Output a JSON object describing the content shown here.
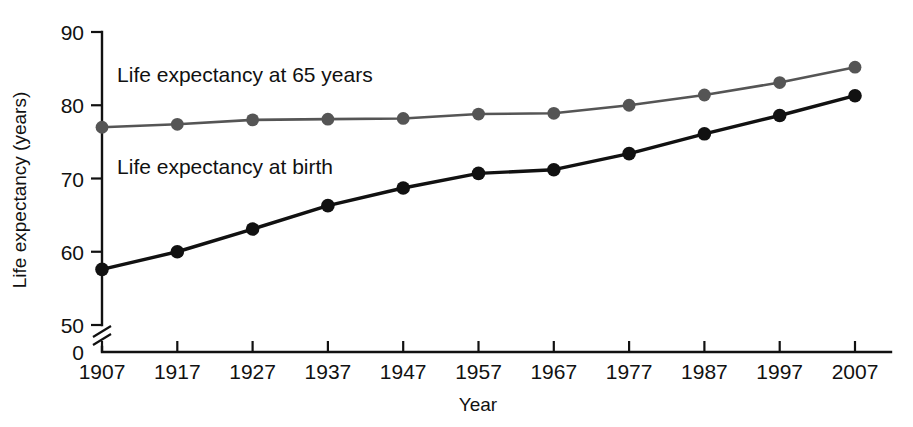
{
  "chart_data": {
    "type": "line",
    "title": "",
    "xlabel": "Year",
    "ylabel": "Life expectancy (years)",
    "categories": [
      "1907",
      "1917",
      "1927",
      "1937",
      "1947",
      "1957",
      "1967",
      "1977",
      "1987",
      "1997",
      "2007"
    ],
    "x": [
      1907,
      1917,
      1927,
      1937,
      1947,
      1957,
      1967,
      1977,
      1987,
      1997,
      2007
    ],
    "xlim": [
      1907,
      2007
    ],
    "ylim": [
      50,
      90
    ],
    "yticks": [
      50,
      60,
      70,
      80,
      90
    ],
    "y_axis_break": true,
    "y_axis_break_label": "0",
    "grid": false,
    "legend": "inline-labels",
    "series": [
      {
        "name": "Life expectancy at 65 years",
        "color": "#555555",
        "values": [
          77.0,
          77.4,
          78.0,
          78.1,
          78.2,
          78.8,
          78.9,
          80.0,
          81.4,
          83.1,
          85.2
        ],
        "label_x": 1909,
        "label_y": 83.2
      },
      {
        "name": "Life expectancy at birth",
        "color": "#111111",
        "values": [
          57.6,
          60.0,
          63.1,
          66.3,
          68.7,
          70.7,
          71.2,
          73.4,
          76.1,
          78.6,
          81.3
        ],
        "label_x": 1909,
        "label_y": 70.6
      }
    ]
  }
}
